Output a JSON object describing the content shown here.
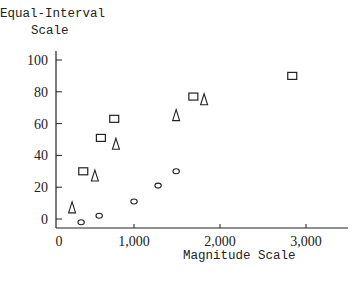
{
  "chart_data": {
    "type": "scatter",
    "title": "",
    "xlabel": "Magnitude Scale",
    "ylabel": "Equal-Interval Scale",
    "ylabel_lines": [
      "Equal-Interval",
      "Scale"
    ],
    "xlim": [
      0,
      3500
    ],
    "ylim": [
      -5,
      105
    ],
    "x_ticks": [
      0,
      1000,
      2000,
      3000
    ],
    "x_tick_labels": [
      "0",
      "1,000",
      "2,000",
      "3,000"
    ],
    "y_ticks": [
      0,
      20,
      40,
      60,
      80,
      100
    ],
    "y_tick_labels": [
      "0",
      "20",
      "40",
      "60",
      "80",
      "100"
    ],
    "grid": false,
    "legend": null,
    "series": [
      {
        "name": "squares",
        "marker": "square",
        "x": [
          410,
          615,
          770,
          1690,
          2840
        ],
        "y": [
          30,
          51,
          63,
          77,
          90
        ]
      },
      {
        "name": "triangles",
        "marker": "triangle",
        "x": [
          280,
          545,
          790,
          1490,
          1815
        ],
        "y": [
          7,
          27,
          47,
          65,
          75
        ]
      },
      {
        "name": "circles",
        "marker": "circle",
        "x": [
          385,
          595,
          1000,
          1280,
          1490
        ],
        "y": [
          -2,
          2,
          11,
          21,
          30
        ]
      }
    ]
  },
  "colors": {
    "ink": "#222222",
    "background": "#ffffff"
  }
}
